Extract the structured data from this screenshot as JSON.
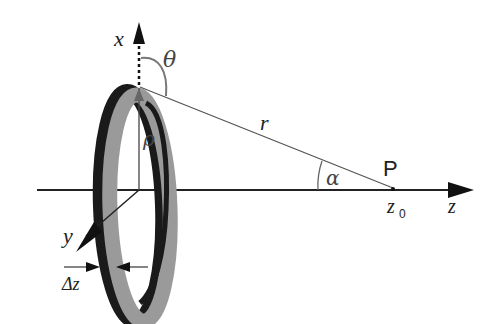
{
  "diagram": {
    "type": "ring-charge-geometry",
    "labels": {
      "x_axis": "x",
      "y_axis": "y",
      "z_axis": "z",
      "theta": "θ",
      "rho": "ρ",
      "r": "r",
      "alpha": "α",
      "point": "P",
      "z0_base": "z",
      "z0_sub": "0",
      "delta_z": "Δz"
    },
    "colors": {
      "ring_gray": "#9a9a9a",
      "ring_dark": "#1a1a1a",
      "axis": "#222222",
      "line": "#555555"
    }
  }
}
